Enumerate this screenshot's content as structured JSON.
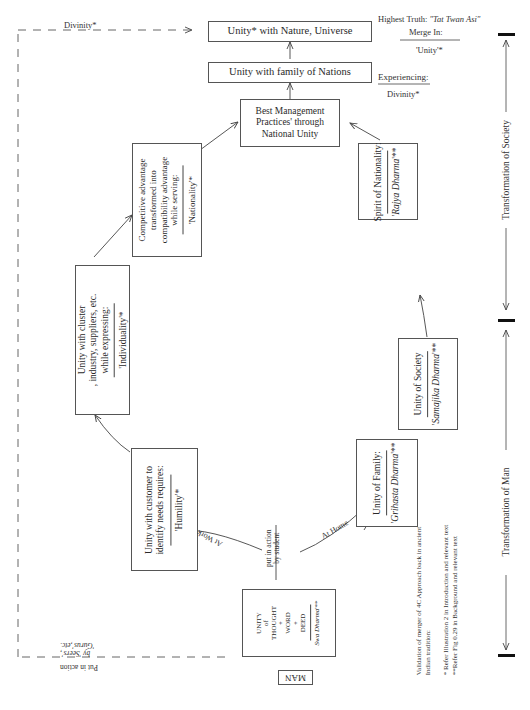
{
  "diagram": {
    "nodes": {
      "unity_nature": {
        "label": "Unity* with Nature, Universe"
      },
      "unity_nations": {
        "label": "Unity with family of Nations"
      },
      "best_mgmt": {
        "lines": [
          "Best Management",
          "Practices' through",
          "National Unity"
        ]
      },
      "competitive": {
        "lines": [
          "Competitive advantage",
          "transformed into",
          "compatibility advantage",
          "while serving:"
        ],
        "value": "'Nationality'*"
      },
      "cluster": {
        "lines": [
          "Unity with cluster",
          ", industry, suppliers, etc.",
          "while expressing:"
        ],
        "value": "'Individuality'*"
      },
      "customer": {
        "lines": [
          "Unity with customer to",
          "identify needs requires:"
        ],
        "value": "'Humility'*"
      },
      "nationality_spirit": {
        "lines": [
          "Spirit of Nationality:"
        ],
        "value_prefix": "'",
        "value_italic": "Rajya Dharma",
        "value_suffix": "'**"
      },
      "society": {
        "lines": [
          "Unity of Society"
        ],
        "value_prefix": "'",
        "value_italic": "Samajika Dharma",
        "value_suffix": "'**"
      },
      "family": {
        "lines": [
          "Unity of Family:"
        ],
        "value_prefix": "'",
        "value_italic": "Grihasta Dharma",
        "value_suffix": "'**"
      },
      "man_unity": {
        "lines": [
          "UNITY",
          "of",
          "THOUGHT",
          "+",
          "WORD",
          "+",
          "DEED"
        ],
        "value_italic": "Swa Dharma",
        "value_suffix": "'**"
      },
      "man": {
        "label": "MAN"
      }
    },
    "edge_labels": {
      "divinity_top": "Divinity*",
      "at_work": "At Work",
      "at_home": "At Home",
      "put_in_action_student_1": "put in action",
      "put_in_action_student_2": "by student",
      "put_in_action_seers_1": "Put in action",
      "put_in_action_seers_2": "by 'Seers',",
      "put_in_action_seers_3": "'Gurus',etc."
    },
    "right_notes": {
      "highest_truth_prefix": "Highest Truth: ",
      "highest_truth_italic": "\"Tat Twan Asi\"",
      "merge_in": "Merge In:",
      "unity": "'Unity'*",
      "experiencing": "Experiencing:",
      "divinity": "Divinity*"
    },
    "axis": {
      "society": "Transformation of Society",
      "man": "Transformation of Man"
    },
    "footnotes": {
      "validation_1": "Validation of merger of 4C Approach back in ancient",
      "validation_2": "Indian tradition:",
      "note_1": "* Refer Illustration 2 in Introduction and relevant text",
      "note_2": "**Refer Fig 0.29 in Background and relevant text"
    }
  }
}
